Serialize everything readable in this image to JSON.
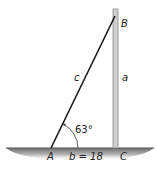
{
  "diagram": {
    "vertices": {
      "A": "A",
      "B": "B",
      "C": "C"
    },
    "sides": {
      "c": "c",
      "a": "a",
      "b": "b = 18"
    },
    "angle_A": "63°",
    "colors": {
      "line": "#1a1a1a",
      "pole": "#c8c8c8",
      "pole_edge": "#8a8a8a",
      "ground_top": "#6e6e6e",
      "ground_bottom": "#ffffff"
    }
  }
}
